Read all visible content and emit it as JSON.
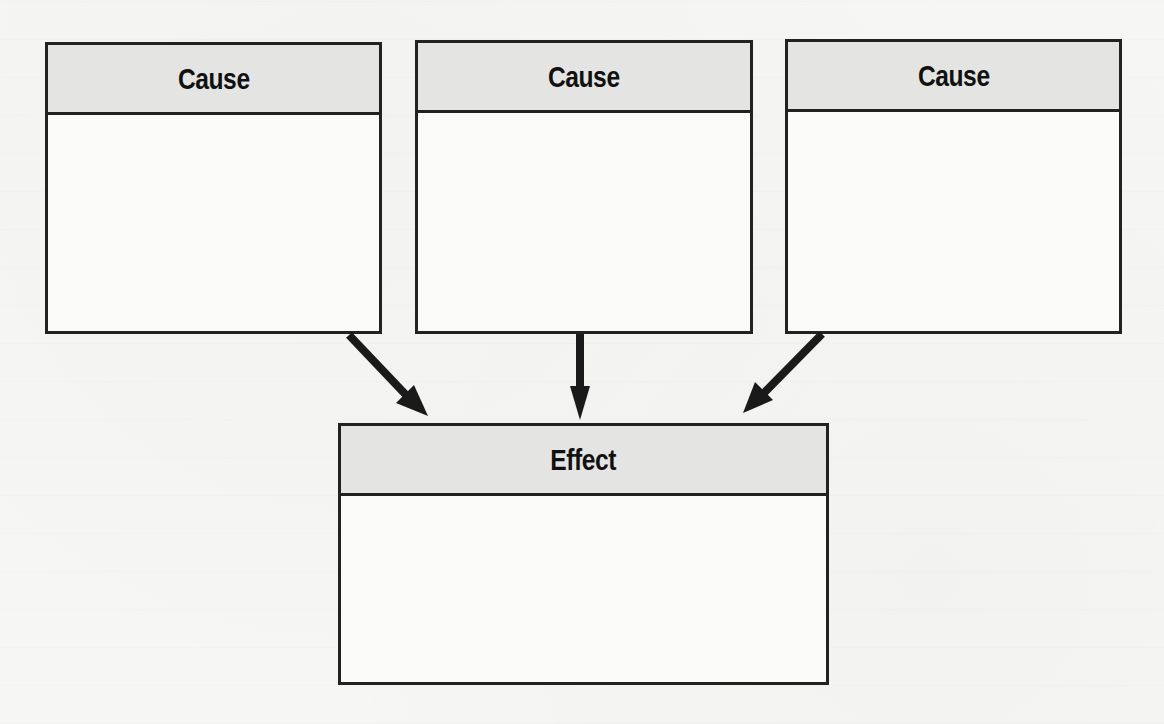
{
  "diagram": {
    "type": "cause-effect",
    "causes": [
      {
        "label": "Cause",
        "content": ""
      },
      {
        "label": "Cause",
        "content": ""
      },
      {
        "label": "Cause",
        "content": ""
      }
    ],
    "effect": {
      "label": "Effect",
      "content": ""
    },
    "arrows": [
      {
        "from": "cause-1",
        "to": "effect"
      },
      {
        "from": "cause-2",
        "to": "effect"
      },
      {
        "from": "cause-3",
        "to": "effect"
      }
    ],
    "colors": {
      "border": "#222222",
      "header_fill": "#e4e4e2",
      "body_fill": "#fbfbfa",
      "background": "#f6f6f4",
      "arrow": "#1a1a1a"
    }
  }
}
